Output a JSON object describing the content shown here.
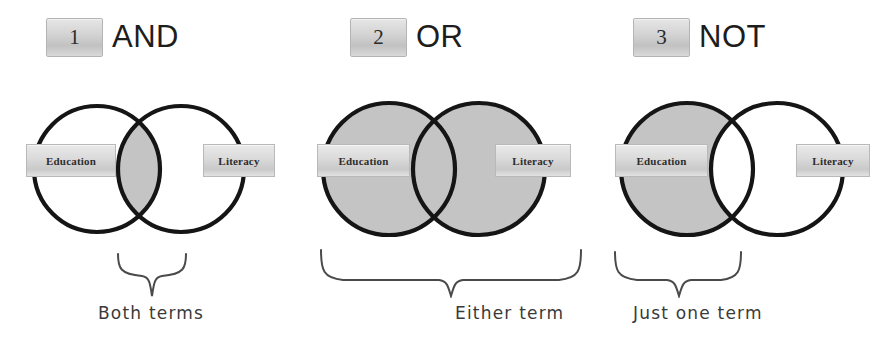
{
  "figure": {
    "terms": {
      "left": "Education",
      "right": "Literacy"
    },
    "colors": {
      "shaded_fill": "#c4c4c4",
      "empty_fill": "#ffffff",
      "circle_stroke": "#151515",
      "brace_stroke": "#4a4a4a",
      "badge_face": "#d3d3d3",
      "caption_text": "#3a3a3a"
    }
  },
  "panels": [
    {
      "number": "1",
      "operator": "AND",
      "left_label": "Education",
      "right_label": "Literacy",
      "caption": "Both terms",
      "shaded_region": "intersection"
    },
    {
      "number": "2",
      "operator": "OR",
      "left_label": "Education",
      "right_label": "Literacy",
      "caption": "Either term",
      "shaded_region": "union"
    },
    {
      "number": "3",
      "operator": "NOT",
      "left_label": "Education",
      "right_label": "Literacy",
      "caption": "Just one term",
      "shaded_region": "left-only"
    }
  ]
}
